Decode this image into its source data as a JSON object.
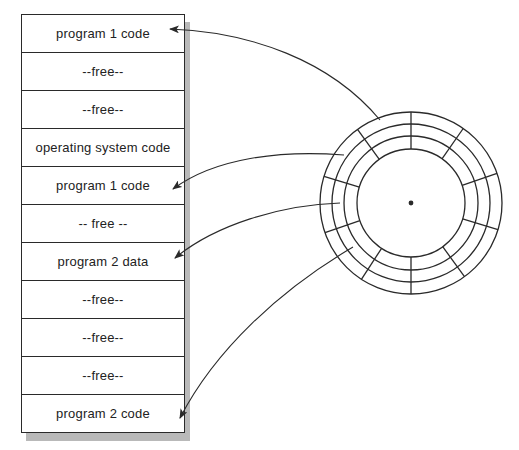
{
  "diagram": {
    "type": "memory-to-disk-mapping",
    "caption": "",
    "memory": {
      "rows": [
        {
          "label": "program 1 code"
        },
        {
          "label": "--free--"
        },
        {
          "label": "--free--"
        },
        {
          "label": "operating system code"
        },
        {
          "label": "program 1 code"
        },
        {
          "label": "-- free --"
        },
        {
          "label": "program  2  data"
        },
        {
          "label": "--free--"
        },
        {
          "label": "--free--"
        },
        {
          "label": "--free--"
        },
        {
          "label": "program 2 code"
        }
      ]
    },
    "disk": {
      "center": [
        411,
        203
      ],
      "ring_radii": [
        91,
        79,
        67,
        54
      ],
      "spoke_angles_deg": [
        90,
        55,
        19,
        -17,
        -54,
        -90,
        -123,
        -161,
        163,
        126
      ],
      "center_dot": true
    },
    "arrows": [
      {
        "from": "disk-outer-track-upper-left",
        "to_row": 0,
        "target_label": "program 1 code"
      },
      {
        "from": "disk-second-track-left",
        "to_row": 4,
        "target_label": "program 1 code"
      },
      {
        "from": "disk-third-track-left",
        "to_row": 6,
        "target_label": "program 2 data"
      },
      {
        "from": "disk-track-lower-left",
        "to_row": 10,
        "target_label": "program 2 code"
      }
    ],
    "colors": {
      "line": "#2a2a2a",
      "shadow": "#b9b9b9",
      "text": "#222222",
      "background": "#ffffff"
    }
  }
}
